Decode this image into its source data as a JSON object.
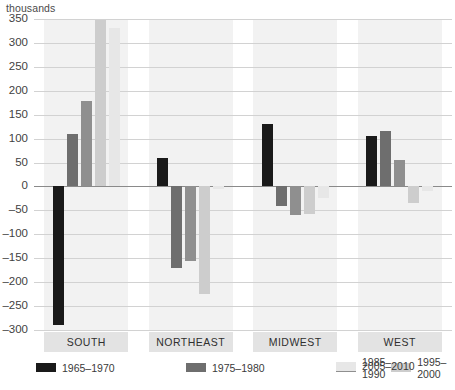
{
  "chart_data": {
    "type": "bar",
    "title": "",
    "subtitle": "",
    "unit_label": "thousands",
    "xlabel": "",
    "ylabel": "thousands",
    "ylim": [
      -300,
      350
    ],
    "ytick_step": 50,
    "ytick_labels": [
      "350",
      "300",
      "250",
      "200",
      "150",
      "100",
      "50",
      "0",
      "–50",
      "–100",
      "–150",
      "–200",
      "–250",
      "–300"
    ],
    "ytick_values": [
      350,
      300,
      250,
      200,
      150,
      100,
      50,
      0,
      -50,
      -100,
      -150,
      -200,
      -250,
      -300
    ],
    "grid": true,
    "legend_position": "bottom-left",
    "categories": [
      "SOUTH",
      "NORTHEAST",
      "MIDWEST",
      "WEST"
    ],
    "series": [
      {
        "name": "1965–1970",
        "color": "#1a1a1a",
        "values": [
          -290,
          60,
          130,
          105
        ]
      },
      {
        "name": "1975–1980",
        "color": "#6e6e6e",
        "values": [
          110,
          -170,
          -40,
          115
        ]
      },
      {
        "name": "1985–1990",
        "color": "#8f8f8f",
        "values": [
          178,
          -155,
          -60,
          55
        ]
      },
      {
        "name": "1995–2000",
        "color": "#cdcdcd",
        "values": [
          348,
          -225,
          -58,
          -35
        ]
      },
      {
        "name": "2005–2010",
        "color": "#e7e7e7",
        "values": [
          332,
          -5,
          -25,
          -10
        ]
      }
    ]
  },
  "legend": {
    "items": [
      {
        "label": "1965–1970",
        "color": "#1a1a1a"
      },
      {
        "label": "1975–1980",
        "color": "#6e6e6e"
      },
      {
        "label": "1985–1990",
        "color": "#8f8f8f"
      },
      {
        "label": "1995–2000",
        "color": "#cdcdcd"
      },
      {
        "label": "2005–2010",
        "color": "#e7e7e7"
      }
    ]
  },
  "colors": {
    "gridline": "#d2d2d2",
    "zero_axis": "#8a8a8a",
    "band": "#f2f2f2",
    "category_box": "#e3e3e3",
    "text": "#3a3a3a"
  }
}
